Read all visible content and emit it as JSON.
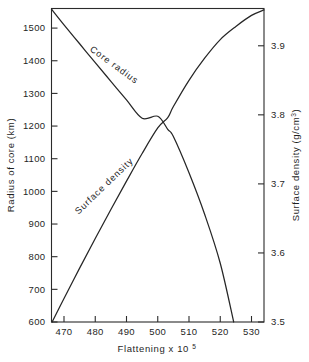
{
  "figure": {
    "background_color": "#ffffff",
    "ink_color": "#262626"
  },
  "chart_data": {
    "type": "line",
    "title": "",
    "subtitle": "",
    "xlabel": "Flattening x 10",
    "xlabel_exponent": "5",
    "ylabel": "Radius of core (km)",
    "y2label": "Surface density (g/cm",
    "y2label_exponent": "3",
    "y2label_suffix": ")",
    "grid": false,
    "legend": "inline-curve-labels",
    "xlim": [
      466,
      534
    ],
    "ylim": [
      600,
      1560
    ],
    "y2lim": [
      3.5,
      3.954
    ],
    "xticks": [
      470,
      480,
      490,
      500,
      510,
      520,
      530
    ],
    "xticklabels": [
      "470",
      "480",
      "490",
      "500",
      "510",
      "520",
      "530"
    ],
    "yticks": [
      600,
      700,
      800,
      900,
      1000,
      1100,
      1200,
      1300,
      1400,
      1500
    ],
    "yticklabels": [
      "600",
      "700",
      "800",
      "900",
      "1000",
      "1100",
      "1200",
      "1300",
      "1400",
      "1500"
    ],
    "y2ticks": [
      3.5,
      3.6,
      3.7,
      3.8,
      3.9
    ],
    "y2ticklabels": [
      "3.5",
      "3.6",
      "3.7",
      "3.8",
      "3.9"
    ],
    "series": [
      {
        "name": "Core radius",
        "axis": "left",
        "label_text": "Core radius",
        "label_x": 485.5,
        "label_y": 1380,
        "label_rotation": 36,
        "x": [
          466.0,
          470.0,
          475.0,
          480.0,
          485.0,
          490.0,
          495.0,
          500.0,
          503.2,
          505.0,
          510.0,
          515.0,
          520.0,
          524.3
        ],
        "values": [
          1558,
          1510,
          1452,
          1394,
          1337,
          1280,
          1224,
          1230,
          1190,
          1168,
          1057,
          930,
          780,
          600
        ]
      },
      {
        "name": "Surface density",
        "axis": "right",
        "label_text": "Surface density",
        "label_x": 483.5,
        "label_y": 1010,
        "label_rotation": -44,
        "x": [
          466.2,
          470.0,
          475.0,
          480.0,
          485.0,
          490.0,
          495.0,
          500.0,
          503.2,
          505.0,
          510.0,
          515.0,
          520.0,
          525.0,
          530.0,
          534.0
        ],
        "values": [
          3.5,
          3.534,
          3.578,
          3.621,
          3.663,
          3.704,
          3.744,
          3.781,
          3.796,
          3.812,
          3.85,
          3.882,
          3.909,
          3.928,
          3.944,
          3.952
        ]
      }
    ]
  }
}
